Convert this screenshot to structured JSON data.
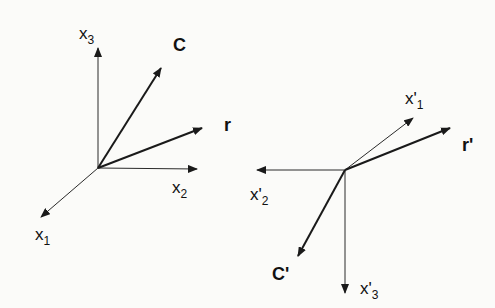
{
  "diagram": {
    "left_frame": {
      "axes": [
        {
          "id": "x1",
          "label": "x",
          "subscript": "1"
        },
        {
          "id": "x2",
          "label": "x",
          "subscript": "2"
        },
        {
          "id": "x3",
          "label": "x",
          "subscript": "3"
        }
      ],
      "vectors": [
        {
          "id": "C",
          "label": "C"
        },
        {
          "id": "r",
          "label": "r"
        }
      ]
    },
    "right_frame": {
      "axes": [
        {
          "id": "x1p",
          "label": "x'",
          "subscript": "1"
        },
        {
          "id": "x2p",
          "label": "x'",
          "subscript": "2"
        },
        {
          "id": "x3p",
          "label": "x'",
          "subscript": "3"
        }
      ],
      "vectors": [
        {
          "id": "Cp",
          "label": "C'"
        },
        {
          "id": "rp",
          "label": "r'"
        }
      ]
    }
  }
}
